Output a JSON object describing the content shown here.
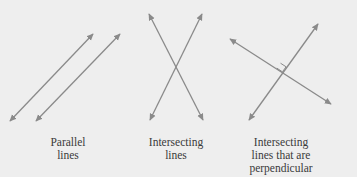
{
  "colors": {
    "background": "#eeeeee",
    "line": "#8a8a8a",
    "text": "#3a3a3a"
  },
  "panels": [
    {
      "id": "parallel",
      "label_lines": [
        "Parallel",
        "lines"
      ],
      "lines": [
        {
          "x1": 10,
          "y1": 121,
          "x2": 93,
          "y2": 34
        },
        {
          "x1": 36,
          "y1": 121,
          "x2": 120,
          "y2": 34
        }
      ]
    },
    {
      "id": "intersecting",
      "label_lines": [
        "Intersecting",
        "lines"
      ],
      "lines": [
        {
          "x1": 149,
          "y1": 14,
          "x2": 203,
          "y2": 120
        },
        {
          "x1": 202,
          "y1": 14,
          "x2": 150,
          "y2": 120
        }
      ]
    },
    {
      "id": "perpendicular",
      "label_lines": [
        "Intersecting",
        "lines that are",
        "perpendicular"
      ],
      "lines": [
        {
          "x1": 230,
          "y1": 39,
          "x2": 331,
          "y2": 104
        },
        {
          "x1": 318,
          "y1": 24,
          "x2": 249,
          "y2": 120
        }
      ],
      "right_angle_marker": true
    }
  ]
}
